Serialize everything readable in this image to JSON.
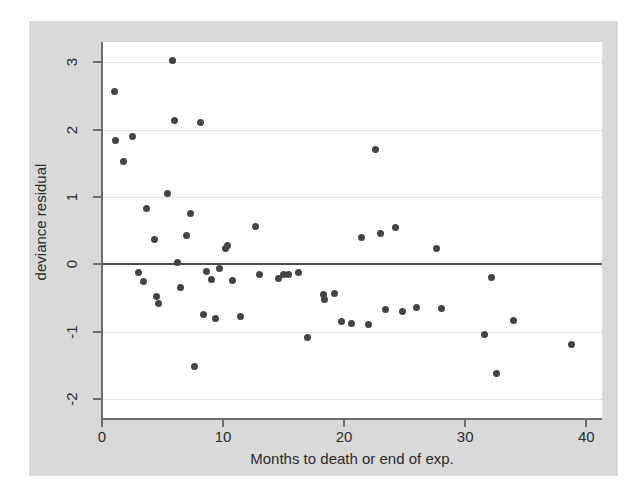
{
  "chart_data": {
    "type": "scatter",
    "title": "",
    "xlabel": "Months to death or end of exp.",
    "ylabel": "deviance residual",
    "xlim": [
      0,
      41.3
    ],
    "ylim": [
      -2.3,
      3.3
    ],
    "xticks": [
      0,
      10,
      20,
      30,
      40
    ],
    "xtick_labels": [
      "0",
      "10",
      "20",
      "30",
      "40"
    ],
    "yticks": [
      3,
      2,
      1,
      0,
      -1,
      -2
    ],
    "ytick_labels": [
      "3",
      "2",
      "1",
      "0",
      "-1",
      "-2"
    ],
    "grid": "horizontal",
    "reference_line_y": 0,
    "legend": "none",
    "marker_color": "#444444",
    "plot_bg": "#ffffff",
    "figure_bg": "#d9d9d9",
    "n_points": 63,
    "points": [
      [
        1.0,
        2.56
      ],
      [
        1.1,
        1.84
      ],
      [
        1.8,
        1.53
      ],
      [
        2.5,
        1.9
      ],
      [
        3.0,
        -0.13
      ],
      [
        3.4,
        -0.26
      ],
      [
        3.7,
        0.83
      ],
      [
        4.3,
        0.36
      ],
      [
        4.5,
        -0.48
      ],
      [
        4.7,
        -0.58
      ],
      [
        5.4,
        1.05
      ],
      [
        5.8,
        3.03
      ],
      [
        6.0,
        2.14
      ],
      [
        6.2,
        0.02
      ],
      [
        6.5,
        -0.34
      ],
      [
        7.0,
        0.43
      ],
      [
        7.3,
        0.75
      ],
      [
        7.6,
        -1.52
      ],
      [
        8.1,
        2.11
      ],
      [
        8.4,
        -0.75
      ],
      [
        8.6,
        -0.11
      ],
      [
        9.0,
        -0.22
      ],
      [
        9.4,
        -0.8
      ],
      [
        9.7,
        -0.06
      ],
      [
        10.2,
        0.24
      ],
      [
        10.4,
        0.28
      ],
      [
        10.8,
        -0.24
      ],
      [
        11.4,
        -0.78
      ],
      [
        12.7,
        0.56
      ],
      [
        13.0,
        -0.16
      ],
      [
        14.6,
        -0.21
      ],
      [
        15.0,
        -0.15
      ],
      [
        15.4,
        -0.16
      ],
      [
        16.2,
        -0.13
      ],
      [
        17.0,
        -1.09
      ],
      [
        18.3,
        -0.45
      ],
      [
        18.4,
        -0.52
      ],
      [
        19.2,
        -0.44
      ],
      [
        19.8,
        -0.85
      ],
      [
        20.6,
        -0.88
      ],
      [
        21.4,
        0.4
      ],
      [
        22.0,
        -0.9
      ],
      [
        22.6,
        1.7
      ],
      [
        23.0,
        0.46
      ],
      [
        23.4,
        -0.68
      ],
      [
        24.2,
        0.55
      ],
      [
        24.8,
        -0.7
      ],
      [
        26.0,
        -0.65
      ],
      [
        27.6,
        0.23
      ],
      [
        28.0,
        -0.66
      ],
      [
        31.6,
        -1.04
      ],
      [
        32.2,
        -0.2
      ],
      [
        32.6,
        -1.63
      ],
      [
        34.0,
        -0.84
      ],
      [
        38.8,
        -1.2
      ]
    ]
  },
  "axes": {
    "y_label_text": "deviance residual",
    "x_label_text": "Months to death or end of exp."
  }
}
